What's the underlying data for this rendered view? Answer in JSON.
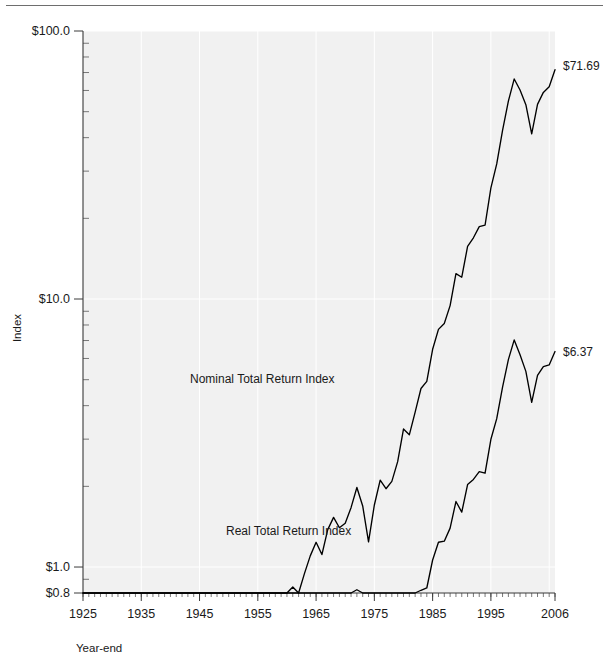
{
  "figure": {
    "name": "stock-market-total-return-index-chart",
    "top_rule": true
  },
  "chart_data": {
    "type": "line",
    "title": "",
    "xlabel": "Year-end",
    "ylabel": "Index",
    "yscale": "log",
    "ylim": [
      0.8,
      100.0
    ],
    "xlim": [
      1925,
      2006
    ],
    "grid": true,
    "legend": "inline-labels",
    "y_tick_labels": [
      {
        "value": 100.0,
        "label": "$100.0"
      },
      {
        "value": 10.0,
        "label": "$10.0"
      },
      {
        "value": 1.0,
        "label": "$1.0"
      },
      {
        "value": 0.8,
        "label": "$0.8"
      }
    ],
    "x_tick_labels": [
      "1925",
      "1935",
      "1945",
      "1955",
      "1965",
      "1975",
      "1985",
      "1995",
      "2006"
    ],
    "x_tick_values": [
      1925,
      1935,
      1945,
      1955,
      1965,
      1975,
      1985,
      1995,
      2006
    ],
    "x_minor_tick_interval": 1,
    "annotations": [
      {
        "name": "nominal-series-label",
        "text": "Nominal Total Return Index",
        "x": 1969,
        "y": 3.35
      },
      {
        "name": "real-series-label",
        "text": "Real Total Return Index",
        "x": 1963.5,
        "y": 1.52
      },
      {
        "name": "nominal-endpoint-label",
        "text": "$71.69",
        "x": 2006,
        "y": 71.69
      },
      {
        "name": "real-endpoint-label",
        "text": "$6.37",
        "x": 2006,
        "y": 6.37
      }
    ],
    "series": [
      {
        "name": "Nominal Total Return Index",
        "color": "#000000",
        "final_value": 71.69,
        "x": [
          1925,
          1926,
          1927,
          1928,
          1929,
          1930,
          1931,
          1932,
          1933,
          1934,
          1935,
          1936,
          1937,
          1938,
          1939,
          1940,
          1941,
          1942,
          1943,
          1944,
          1945,
          1946,
          1947,
          1948,
          1949,
          1950,
          1951,
          1952,
          1953,
          1954,
          1955,
          1956,
          1957,
          1958,
          1959,
          1960,
          1961,
          1962,
          1963,
          1964,
          1965,
          1966,
          1967,
          1968,
          1969,
          1970,
          1971,
          1972,
          1973,
          1974,
          1975,
          1976,
          1977,
          1978,
          1979,
          1980,
          1981,
          1982,
          1983,
          1984,
          1985,
          1986,
          1987,
          1988,
          1989,
          1990,
          1991,
          1992,
          1993,
          1994,
          1995,
          1996,
          1997,
          1998,
          1999,
          2000,
          2001,
          2002,
          2003,
          2004,
          2005,
          2006
        ],
        "values": [
          1.0,
          1.12,
          1.54,
          2.2,
          2.02,
          1.52,
          0.86,
          0.79,
          1.22,
          1.2,
          1.78,
          2.38,
          1.54,
          2.02,
          2.01,
          1.81,
          1.6,
          1.93,
          2.43,
          2.91,
          3.97,
          3.65,
          3.86,
          4.07,
          4.84,
          6.38,
          7.91,
          9.38,
          9.29,
          14.17,
          18.64,
          19.87,
          17.73,
          25.45,
          28.49,
          28.63,
          36.3,
          33.13,
          40.7,
          47.41,
          53.3,
          47.94,
          59.42,
          65.99,
          60.39,
          62.78,
          71.75,
          85.34,
          72.79,
          53.51,
          73.41,
          90.93,
          84.42,
          89.95,
          106.53,
          141.0,
          134.1,
          162.93,
          199.64,
          212.34,
          279.76,
          331.88,
          349.26,
          407.11,
          536.03,
          519.42,
          677.41,
          729.12,
          802.47,
          812.99,
          1118.67,
          1375.28,
          1833.75,
          2357.95,
          2853.63,
          2594.21,
          2286.33,
          1781.66,
          2292.67,
          2542.01,
          2667.19,
          3088.32
        ]
      },
      {
        "name": "Real Total Return Index",
        "color": "#000000",
        "final_value": 6.37,
        "x": [
          1925,
          1926,
          1927,
          1928,
          1929,
          1930,
          1931,
          1932,
          1933,
          1934,
          1935,
          1936,
          1937,
          1938,
          1939,
          1940,
          1941,
          1942,
          1943,
          1944,
          1945,
          1946,
          1947,
          1948,
          1949,
          1950,
          1951,
          1952,
          1953,
          1954,
          1955,
          1956,
          1957,
          1958,
          1959,
          1960,
          1961,
          1962,
          1963,
          1964,
          1965,
          1966,
          1967,
          1968,
          1969,
          1970,
          1971,
          1972,
          1973,
          1974,
          1975,
          1976,
          1977,
          1978,
          1979,
          1980,
          1981,
          1982,
          1983,
          1984,
          1985,
          1986,
          1987,
          1988,
          1989,
          1990,
          1991,
          1992,
          1993,
          1994,
          1995,
          1996,
          1997,
          1998,
          1999,
          2000,
          2001,
          2002,
          2003,
          2004,
          2005,
          2006
        ],
        "values": [
          1.0,
          1.14,
          1.6,
          2.29,
          2.1,
          1.73,
          1.09,
          1.12,
          1.71,
          1.64,
          2.38,
          3.14,
          1.96,
          2.6,
          2.59,
          2.31,
          1.83,
          1.99,
          2.37,
          2.79,
          3.72,
          3.07,
          2.97,
          3.02,
          3.63,
          4.55,
          5.22,
          6.07,
          5.97,
          9.12,
          11.96,
          12.56,
          10.84,
          15.14,
          16.74,
          16.54,
          20.75,
          18.7,
          22.67,
          26.06,
          28.79,
          25.18,
          30.33,
          32.31,
          28.05,
          27.58,
          30.21,
          34.77,
          27.3,
          18.06,
          22.75,
          26.65,
          23.22,
          22.86,
          24.29,
          29.1,
          25.11,
          29.5,
          34.61,
          35.29,
          44.88,
          52.27,
          52.76,
          59.01,
          74.18,
          67.73,
          85.78,
          89.65,
          95.86,
          94.62,
          126.61,
          151.21,
          198.25,
          251.12,
          297.41,
          261.59,
          226.97,
          174.02,
          219.11,
          236.42,
          239.9,
          269.16
        ]
      }
    ]
  },
  "axes": {
    "y_axis_title": "Index",
    "x_axis_title": "Year-end"
  }
}
